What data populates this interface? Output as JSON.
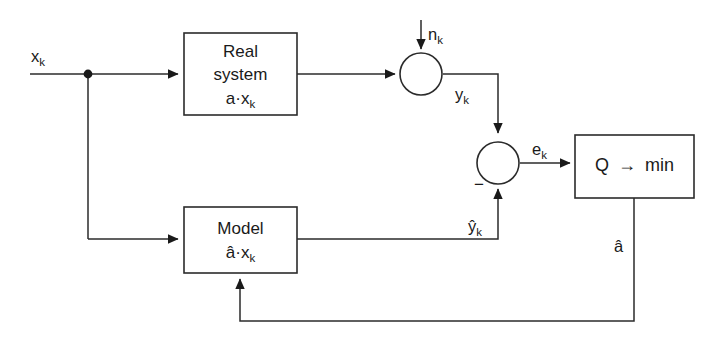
{
  "diagram": {
    "stroke_color": "#2b2b2b",
    "text_color": "#1a1a1a",
    "background": "#ffffff",
    "blocks": [
      {
        "id": "real-system",
        "line1": "Real",
        "line2": "system",
        "line3_base": "a",
        "line3_dot": "·",
        "line3_var": "x",
        "line3_sub": "k"
      },
      {
        "id": "model",
        "line1": "Model",
        "line3_base": "â",
        "line3_dot": "·",
        "line3_var": "x",
        "line3_sub": "k"
      },
      {
        "id": "criterion",
        "left": "Q",
        "arrow": "→",
        "right": "min"
      }
    ],
    "junctions": [
      {
        "id": "sum-noise",
        "sign": ""
      },
      {
        "id": "sum-error",
        "sign": "−"
      }
    ],
    "signals": [
      {
        "id": "input",
        "base": "x",
        "sub": "k"
      },
      {
        "id": "noise",
        "base": "n",
        "sub": "k"
      },
      {
        "id": "output",
        "base": "y",
        "sub": "k"
      },
      {
        "id": "model-output",
        "base": "ŷ",
        "sub": "k"
      },
      {
        "id": "error",
        "base": "e",
        "sub": "k"
      },
      {
        "id": "parameter",
        "base": "â",
        "sub": ""
      }
    ]
  }
}
